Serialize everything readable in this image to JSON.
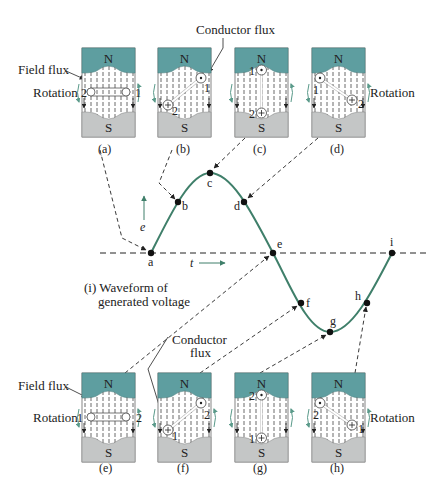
{
  "figure": {
    "title_line1": "(i) Waveform of",
    "title_line2": "generated voltage",
    "labels": {
      "conductor_flux_top": "Conductor flux",
      "conductor_flux_bottom_1": "Conductor",
      "conductor_flux_bottom_2": "flux",
      "field_flux_top": "Field flux",
      "field_flux_bottom": "Field flux",
      "rotation_a": "Rotation",
      "rotation_d": "Rotation",
      "rotation_e": "Rotation",
      "rotation_h": "Rotation",
      "axis_e": "e",
      "axis_t": "t",
      "north": "N",
      "south": "S"
    },
    "panels_top": [
      {
        "id": "a",
        "caption": "(a)",
        "left": "2",
        "right": "1"
      },
      {
        "id": "b",
        "caption": "(b)",
        "c1": "1",
        "c2": "2"
      },
      {
        "id": "c",
        "caption": "(c)",
        "c1": "1",
        "c2": "2"
      },
      {
        "id": "d",
        "caption": "(d)",
        "c1": "1",
        "c2": "2"
      }
    ],
    "panels_bottom": [
      {
        "id": "e",
        "caption": "(e)",
        "left": "1",
        "right": "2"
      },
      {
        "id": "f",
        "caption": "(f)",
        "c1": "2",
        "c2": "1"
      },
      {
        "id": "g",
        "caption": "(g)",
        "c1": "2",
        "c2": "1"
      },
      {
        "id": "h",
        "caption": "(h)",
        "c1": "2",
        "c2": "1"
      }
    ],
    "waveform_points": [
      {
        "label": "a"
      },
      {
        "label": "b"
      },
      {
        "label": "c"
      },
      {
        "label": "d"
      },
      {
        "label": "e"
      },
      {
        "label": "f"
      },
      {
        "label": "g"
      },
      {
        "label": "h"
      },
      {
        "label": "i"
      }
    ],
    "colors": {
      "north_pole": "#5e9ea0",
      "south_pole": "#c4c6c6",
      "waveform": "#3f7f6a",
      "rotation_arrow": "#5a9a8a",
      "outline": "#555555"
    }
  }
}
